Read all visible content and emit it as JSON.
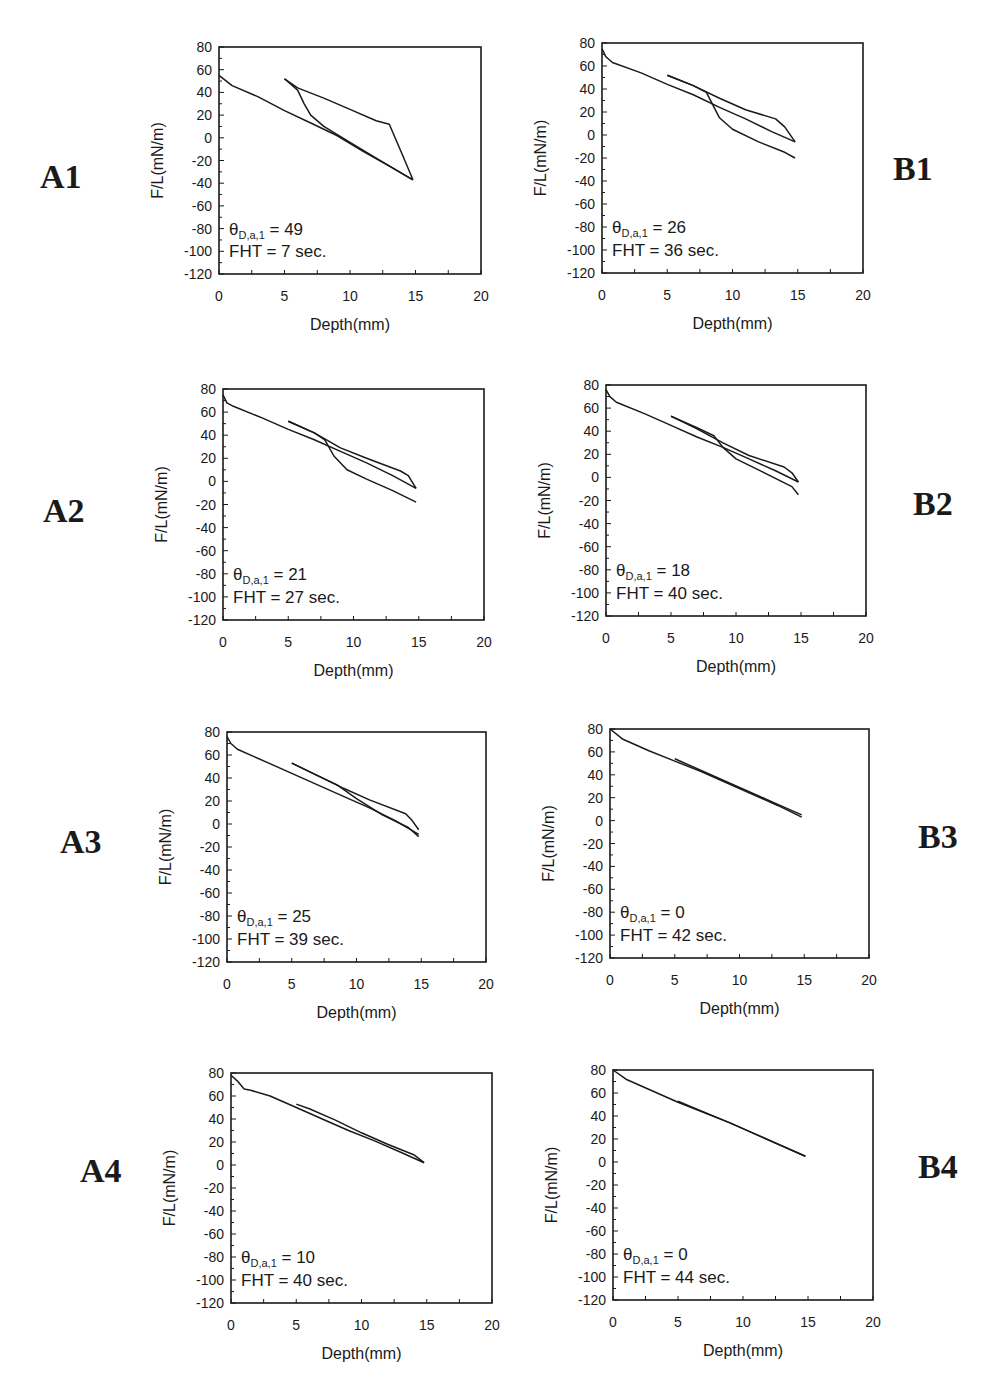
{
  "chart_data": [
    {
      "id": "A1",
      "type": "line",
      "xlabel": "Depth(mm)",
      "ylabel": "F/L(mN/m)",
      "xlim": [
        0,
        20
      ],
      "ylim": [
        -120,
        80
      ],
      "xticks": [
        0,
        5,
        10,
        15,
        20
      ],
      "yticks": [
        80,
        60,
        40,
        20,
        0,
        -20,
        -40,
        -60,
        -80,
        -100,
        -120
      ],
      "annotation": {
        "theta_label": "θ",
        "theta_sub": "D,a,1",
        "theta_value": "49",
        "fht": "FHT = 7 sec."
      },
      "series": [
        {
          "name": "advancing",
          "x": [
            0,
            1,
            3,
            5,
            7,
            9,
            11,
            13,
            14.8
          ],
          "y": [
            55,
            46,
            36,
            24,
            13,
            2,
            -12,
            -25,
            -37
          ]
        },
        {
          "name": "receding",
          "x": [
            14.8,
            14,
            13,
            12,
            10,
            8,
            6,
            5
          ],
          "y": [
            -37,
            -15,
            12,
            15,
            25,
            35,
            44,
            52
          ]
        },
        {
          "name": "readvancing",
          "x": [
            5,
            6,
            6.5,
            7,
            8,
            10,
            12,
            14.8
          ],
          "y": [
            52,
            42,
            30,
            20,
            10,
            -4,
            -18,
            -37
          ]
        }
      ]
    },
    {
      "id": "B1",
      "type": "line",
      "xlabel": "Depth(mm)",
      "ylabel": "F/L(mN/m)",
      "xlim": [
        0,
        20
      ],
      "ylim": [
        -120,
        80
      ],
      "xticks": [
        0,
        5,
        10,
        15,
        20
      ],
      "yticks": [
        80,
        60,
        40,
        20,
        0,
        -20,
        -40,
        -60,
        -80,
        -100,
        -120
      ],
      "annotation": {
        "theta_label": "θ",
        "theta_sub": "D,a,1",
        "theta_value": "26",
        "fht": "FHT = 36 sec."
      },
      "series": [
        {
          "name": "advancing",
          "x": [
            0,
            0.3,
            0.8,
            3,
            5,
            7,
            9,
            11,
            13,
            14.8
          ],
          "y": [
            75,
            68,
            63,
            54,
            44,
            35,
            24,
            14,
            3,
            -6
          ]
        },
        {
          "name": "receding",
          "x": [
            14.8,
            14,
            13.3,
            11,
            9,
            7,
            5
          ],
          "y": [
            -6,
            7,
            14,
            22,
            32,
            43,
            52
          ]
        },
        {
          "name": "readvancing",
          "x": [
            5,
            7,
            8,
            9,
            10,
            12,
            14,
            14.8
          ],
          "y": [
            52,
            43,
            37,
            15,
            5,
            -6,
            -15,
            -20
          ]
        }
      ]
    },
    {
      "id": "A2",
      "type": "line",
      "xlabel": "Depth(mm)",
      "ylabel": "F/L(mN/m)",
      "xlim": [
        0,
        20
      ],
      "ylim": [
        -120,
        80
      ],
      "xticks": [
        0,
        5,
        10,
        15,
        20
      ],
      "yticks": [
        80,
        60,
        40,
        20,
        0,
        -20,
        -40,
        -60,
        -80,
        -100,
        -120
      ],
      "annotation": {
        "theta_label": "θ",
        "theta_sub": "D,a,1",
        "theta_value": "21",
        "fht": "FHT = 27 sec."
      },
      "series": [
        {
          "name": "advancing",
          "x": [
            0,
            0.3,
            0.8,
            3,
            5,
            7,
            9,
            11,
            13,
            14.8
          ],
          "y": [
            75,
            68,
            65,
            55,
            45,
            36,
            26,
            16,
            5,
            -6
          ]
        },
        {
          "name": "receding",
          "x": [
            14.8,
            14.2,
            13.6,
            11,
            9,
            7,
            5
          ],
          "y": [
            -6,
            5,
            9,
            20,
            29,
            42,
            52
          ]
        },
        {
          "name": "readvancing",
          "x": [
            5,
            7,
            7.8,
            8.5,
            9.5,
            11,
            13,
            14.8
          ],
          "y": [
            52,
            42,
            36,
            22,
            10,
            2,
            -8,
            -18
          ]
        }
      ]
    },
    {
      "id": "B2",
      "type": "line",
      "xlabel": "Depth(mm)",
      "ylabel": "F/L(mN/m)",
      "xlim": [
        0,
        20
      ],
      "ylim": [
        -120,
        80
      ],
      "xticks": [
        0,
        5,
        10,
        15,
        20
      ],
      "yticks": [
        80,
        60,
        40,
        20,
        0,
        -20,
        -40,
        -60,
        -80,
        -100,
        -120
      ],
      "annotation": {
        "theta_label": "θ",
        "theta_sub": "D,a,1",
        "theta_value": "18",
        "fht": "FHT = 40 sec."
      },
      "series": [
        {
          "name": "advancing",
          "x": [
            0,
            0.3,
            0.8,
            3,
            5,
            7,
            9,
            11,
            13,
            14.8
          ],
          "y": [
            76,
            70,
            65,
            55,
            45,
            35,
            26,
            16,
            6,
            -4
          ]
        },
        {
          "name": "receding",
          "x": [
            14.8,
            14.3,
            13.7,
            11,
            9,
            7,
            5
          ],
          "y": [
            -4,
            4,
            9,
            19,
            30,
            42,
            53
          ]
        },
        {
          "name": "readvancing",
          "x": [
            5,
            7,
            8.3,
            9,
            10,
            12,
            14.3,
            14.8
          ],
          "y": [
            53,
            43,
            36,
            26,
            16,
            5,
            -8,
            -15
          ]
        }
      ]
    },
    {
      "id": "A3",
      "type": "line",
      "xlabel": "Depth(mm)",
      "ylabel": "F/L(mN/m)",
      "xlim": [
        0,
        20
      ],
      "ylim": [
        -120,
        80
      ],
      "xticks": [
        0,
        5,
        10,
        15,
        20
      ],
      "yticks": [
        80,
        60,
        40,
        20,
        0,
        -20,
        -40,
        -60,
        -80,
        -100,
        -120
      ],
      "annotation": {
        "theta_label": "θ",
        "theta_sub": "D,a,1",
        "theta_value": "25",
        "fht": "FHT = 39 sec."
      },
      "series": [
        {
          "name": "advancing",
          "x": [
            0,
            0.3,
            0.8,
            3,
            5,
            7,
            9,
            11,
            13,
            14.8
          ],
          "y": [
            76,
            70,
            65,
            54,
            44,
            34,
            24,
            14,
            3,
            -9
          ]
        },
        {
          "name": "receding",
          "x": [
            14.8,
            14.3,
            13.8,
            11,
            9,
            7,
            5
          ],
          "y": [
            -5,
            3,
            9,
            21,
            31,
            42,
            53
          ]
        },
        {
          "name": "readvancing",
          "x": [
            5,
            7,
            8.5,
            10,
            12,
            14,
            14.8
          ],
          "y": [
            53,
            42,
            34,
            22,
            8,
            -3,
            -11
          ]
        }
      ]
    },
    {
      "id": "B3",
      "type": "line",
      "xlabel": "Depth(mm)",
      "ylabel": "F/L(mN/m)",
      "xlim": [
        0,
        20
      ],
      "ylim": [
        -120,
        80
      ],
      "xticks": [
        0,
        5,
        10,
        15,
        20
      ],
      "yticks": [
        80,
        60,
        40,
        20,
        0,
        -20,
        -40,
        -60,
        -80,
        -100,
        -120
      ],
      "annotation": {
        "theta_label": "θ",
        "theta_sub": "D,a,1",
        "theta_value": "0",
        "fht": "FHT = 42 sec."
      },
      "series": [
        {
          "name": "advancing",
          "x": [
            0,
            1,
            3,
            5,
            7,
            9,
            11,
            13,
            14.8
          ],
          "y": [
            80,
            71,
            61,
            52,
            43,
            33,
            23,
            13,
            3
          ]
        },
        {
          "name": "receding",
          "x": [
            14.8,
            13,
            11,
            9,
            7,
            5
          ],
          "y": [
            5,
            14,
            24,
            34,
            44,
            54
          ]
        }
      ]
    },
    {
      "id": "A4",
      "type": "line",
      "xlabel": "Depth(mm)",
      "ylabel": "F/L(mN/m)",
      "xlim": [
        0,
        20
      ],
      "ylim": [
        -120,
        80
      ],
      "xticks": [
        0,
        5,
        10,
        15,
        20
      ],
      "yticks": [
        80,
        60,
        40,
        20,
        0,
        -20,
        -40,
        -60,
        -80,
        -100,
        -120
      ],
      "annotation": {
        "theta_label": "θ",
        "theta_sub": "D,a,1",
        "theta_value": "10",
        "fht": "FHT = 40 sec."
      },
      "series": [
        {
          "name": "advancing",
          "x": [
            0,
            0.5,
            1,
            1.5,
            3,
            5,
            7,
            9,
            11,
            13,
            14.8
          ],
          "y": [
            78,
            73,
            66,
            65,
            60,
            50,
            40,
            30,
            21,
            11,
            2
          ]
        },
        {
          "name": "receding",
          "x": [
            14.8,
            14,
            12,
            10,
            8,
            6,
            5
          ],
          "y": [
            2,
            9,
            18,
            28,
            39,
            49,
            53
          ]
        }
      ]
    },
    {
      "id": "B4",
      "type": "line",
      "xlabel": "Depth(mm)",
      "ylabel": "F/L(mN/m)",
      "xlim": [
        0,
        20
      ],
      "ylim": [
        -120,
        80
      ],
      "xticks": [
        0,
        5,
        10,
        15,
        20
      ],
      "yticks": [
        80,
        60,
        40,
        20,
        0,
        -20,
        -40,
        -60,
        -80,
        -100,
        -120
      ],
      "annotation": {
        "theta_label": "θ",
        "theta_sub": "D,a,1",
        "theta_value": "0",
        "fht": "FHT = 44 sec."
      },
      "series": [
        {
          "name": "advancing",
          "x": [
            0,
            1,
            3,
            5,
            7,
            9,
            11,
            13,
            14.8
          ],
          "y": [
            80,
            72,
            62,
            52,
            43,
            34,
            24,
            14,
            5
          ]
        },
        {
          "name": "receding",
          "x": [
            14.8,
            12,
            9,
            6,
            5
          ],
          "y": [
            5,
            19,
            34,
            48,
            53
          ]
        }
      ]
    }
  ],
  "panels": [
    {
      "label": "A1"
    },
    {
      "label": "B1"
    },
    {
      "label": "A2"
    },
    {
      "label": "B2"
    },
    {
      "label": "A3"
    },
    {
      "label": "B3"
    },
    {
      "label": "A4"
    },
    {
      "label": "B4"
    }
  ]
}
